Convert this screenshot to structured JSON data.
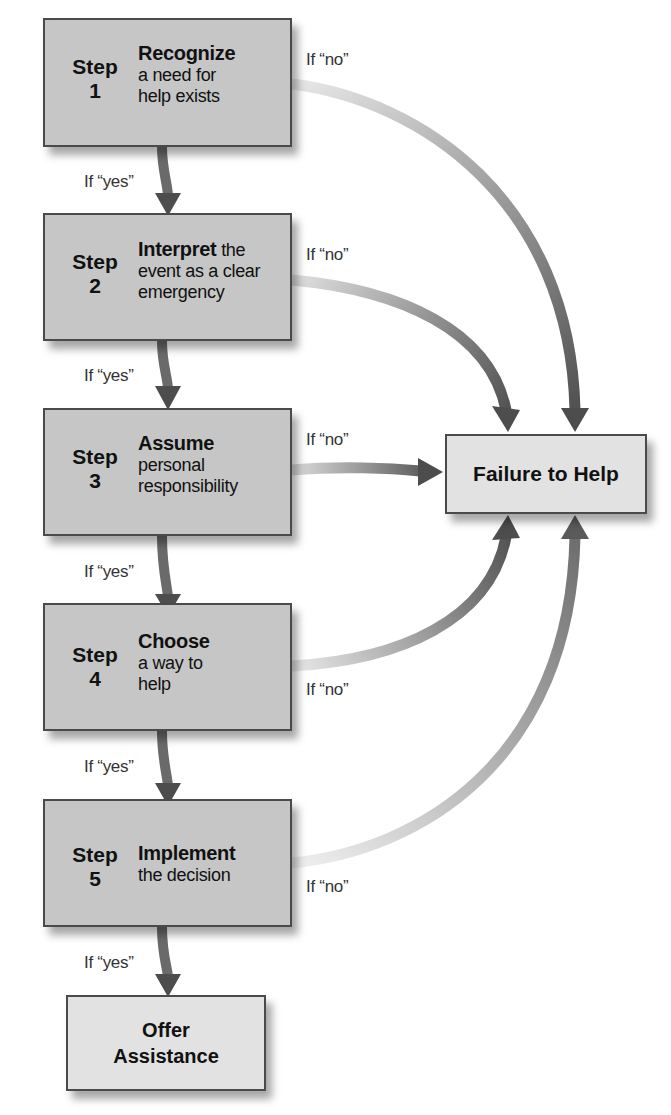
{
  "steps": [
    {
      "step_label": "Step",
      "number": "1",
      "title": "Recognize",
      "title_suffix": "",
      "description": "a need for help exists",
      "lines": [
        "a need for",
        "help exists"
      ]
    },
    {
      "step_label": "Step",
      "number": "2",
      "title": "Interpret",
      "title_suffix": " the",
      "description": "event as a clear emergency",
      "lines": [
        "event as a clear",
        "emergency"
      ]
    },
    {
      "step_label": "Step",
      "number": "3",
      "title": "Assume",
      "title_suffix": "",
      "description": "personal responsibility",
      "lines": [
        "personal",
        "responsibility"
      ]
    },
    {
      "step_label": "Step",
      "number": "4",
      "title": "Choose",
      "title_suffix": "",
      "description": "a way to help",
      "lines": [
        "a way to",
        "help"
      ]
    },
    {
      "step_label": "Step",
      "number": "5",
      "title": "Implement",
      "title_suffix": "",
      "description": "the decision",
      "lines": [
        "the decision"
      ]
    }
  ],
  "outcomes": {
    "failure": {
      "line1": "Failure to Help"
    },
    "success": {
      "line1": "Offer",
      "line2": "Assistance"
    }
  },
  "connector_labels": {
    "yes": "If “yes”",
    "no": "If “no”"
  },
  "colors": {
    "step_box_fill": "#c6c6c6",
    "outcome_box_fill": "#e2e2e2",
    "border": "#4a4a4a",
    "arrow": "#555555"
  }
}
